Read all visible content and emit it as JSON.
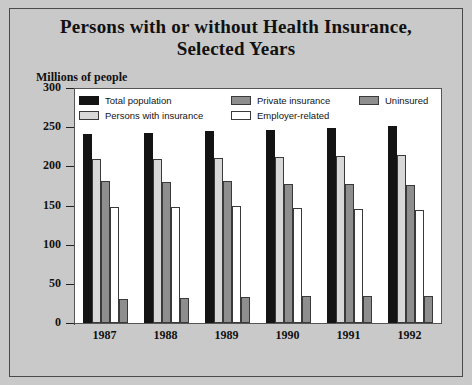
{
  "title": {
    "line1": "Persons with or without Health Insurance,",
    "line2": "Selected Years"
  },
  "axis_label": "Millions of people",
  "legend": [
    {
      "label": "Total population",
      "key": "total",
      "swatch": "black"
    },
    {
      "label": "Private insurance",
      "key": "private",
      "swatch": "#8e8e8e"
    },
    {
      "label": "Uninsured",
      "key": "uninsured",
      "swatch": "#8e8e8e"
    },
    {
      "label": "Persons with insurance",
      "key": "withins",
      "swatch": "#d8d8d8"
    },
    {
      "label": "Employer-related",
      "key": "employer",
      "swatch": "#ffffff"
    }
  ],
  "yticks": [
    "0",
    "50",
    "100",
    "150",
    "200",
    "250",
    "300"
  ],
  "chart_data": {
    "type": "bar",
    "title": "Persons with or without Health Insurance, Selected Years",
    "xlabel": "",
    "ylabel": "Millions of people",
    "ylim": [
      0,
      300
    ],
    "ytick_step": 50,
    "grid": false,
    "legend_position": "top-inside",
    "categories": [
      "1987",
      "1988",
      "1989",
      "1990",
      "1991",
      "1992"
    ],
    "series": [
      {
        "name": "Total population",
        "color": "#141414",
        "values": [
          241,
          243,
          245,
          247,
          249,
          251
        ]
      },
      {
        "name": "Persons with insurance",
        "color": "#d8d8d8",
        "values": [
          210,
          209,
          211,
          212,
          213,
          214
        ]
      },
      {
        "name": "Private insurance",
        "color": "#8e8e8e",
        "values": [
          181,
          180,
          181,
          178,
          177,
          176
        ]
      },
      {
        "name": "Employer-related",
        "color": "#ffffff",
        "values": [
          148,
          148,
          149,
          147,
          146,
          144
        ]
      },
      {
        "name": "Uninsured",
        "color": "#8e8e8e",
        "values": [
          31,
          32,
          33,
          34,
          35,
          35
        ]
      }
    ]
  }
}
